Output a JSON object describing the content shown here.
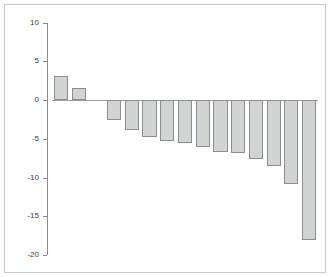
{
  "chart_data": {
    "type": "bar",
    "title": "",
    "subtitle": "",
    "xlabel": "",
    "ylabel": "",
    "categories": [
      "1",
      "2",
      "3",
      "4",
      "5",
      "6",
      "7",
      "8",
      "9",
      "10",
      "11",
      "12",
      "13",
      "14",
      "15"
    ],
    "values": [
      3.1,
      1.5,
      null,
      -2.6,
      -3.9,
      -4.8,
      -5.3,
      -5.5,
      -6.0,
      -6.7,
      -6.8,
      -7.6,
      -8.5,
      -10.8,
      -18.1
    ],
    "ylim": [
      -20,
      10
    ],
    "yticks": [
      10,
      5,
      0,
      -5,
      -10,
      -15,
      -20
    ],
    "ytick_labels": [
      "10",
      "5",
      "0",
      "-5",
      "-10",
      "-15",
      "-20"
    ],
    "xticks": [],
    "xtick_labels": [],
    "grid": false,
    "legend": null,
    "legend_position": "none",
    "annotations": [],
    "bar_fill_color": "#d2d4d3",
    "bar_edge_color": "#8c8e8d",
    "axis_color": "#8a8a8a",
    "frame_color": "#c9c9c9",
    "background_color": "#ffffff"
  }
}
